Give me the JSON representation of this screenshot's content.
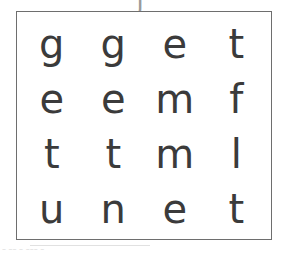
{
  "page": {
    "background_color": "#ffffff",
    "glyph_color": "#3b3b3b",
    "border_color": "#6e6e6e",
    "artifact_color": "#9a9a9a"
  },
  "top_clipped_glyph": {
    "text": "j",
    "description": "clipped-descender-above-box"
  },
  "grid": {
    "rows": 4,
    "columns": 4,
    "cells": [
      [
        {
          "letter": "g"
        },
        {
          "letter": "g"
        },
        {
          "letter": "e"
        },
        {
          "letter": "t"
        }
      ],
      [
        {
          "letter": "e"
        },
        {
          "letter": "e"
        },
        {
          "letter": "m"
        },
        {
          "letter": "f"
        }
      ],
      [
        {
          "letter": "t"
        },
        {
          "letter": "t"
        },
        {
          "letter": "m"
        },
        {
          "letter": "l"
        }
      ],
      [
        {
          "letter": "u"
        },
        {
          "letter": "n"
        },
        {
          "letter": "e"
        },
        {
          "letter": "t"
        }
      ]
    ]
  },
  "bottom_artifact": {
    "text": "– –– – ––– –"
  }
}
